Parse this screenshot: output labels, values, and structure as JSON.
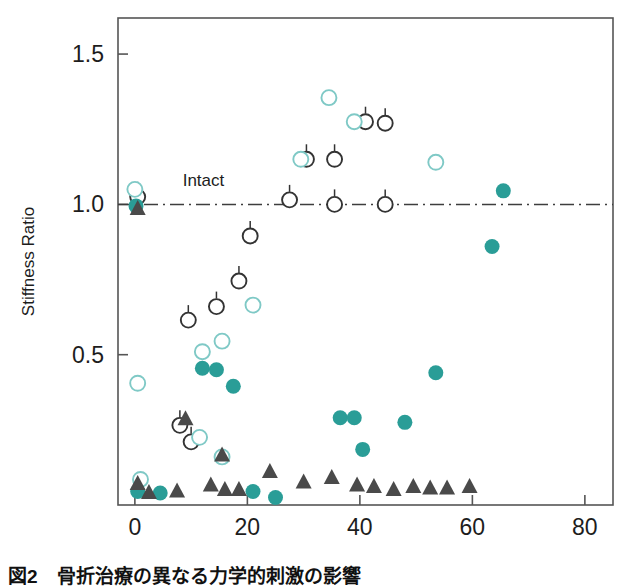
{
  "figure": {
    "caption": "図2　骨折治療の異なる力学的刺激の影響"
  },
  "chart_data": {
    "type": "scatter",
    "title": "",
    "xlabel": "Days, Post-Fracture",
    "ylabel": "Stiffness Ratio",
    "xlim": [
      -3,
      85
    ],
    "ylim": [
      0.0,
      1.62
    ],
    "xticks": [
      0,
      20,
      40,
      60,
      80
    ],
    "xtick_labels": [
      "0",
      "20",
      "40",
      "60",
      "80"
    ],
    "yticks": [
      0.5,
      1.0,
      1.5
    ],
    "ytick_labels": [
      "0.5",
      "1.0",
      "1.5"
    ],
    "grid": false,
    "legend_position": "none",
    "annotations": [
      {
        "text": "Intact",
        "x": 8.5,
        "y": 1.06,
        "line": {
          "type": "dash-dot",
          "y": 1.0,
          "x_start": -3,
          "x_end": 85,
          "color": "#3d3d3d"
        }
      }
    ],
    "colors": {
      "open_dark_circle": "#333333",
      "open_teal_circle": "#7fc9c6",
      "filled_teal_circle": "#2a9d97",
      "filled_dark_triangle": "#4a4a4a",
      "axis": "#555555",
      "background": "#ffffff"
    },
    "series": [
      {
        "name": "Open dark circle (with error bar)",
        "marker": "open-circle-dark",
        "points": [
          {
            "x": 0.5,
            "y": 1.025
          },
          {
            "x": 8.0,
            "y": 0.265
          },
          {
            "x": 9.5,
            "y": 0.615
          },
          {
            "x": 10.0,
            "y": 0.21
          },
          {
            "x": 14.5,
            "y": 0.66
          },
          {
            "x": 18.5,
            "y": 0.745
          },
          {
            "x": 20.5,
            "y": 0.895
          },
          {
            "x": 27.5,
            "y": 1.015
          },
          {
            "x": 30.5,
            "y": 1.15
          },
          {
            "x": 35.5,
            "y": 1.15
          },
          {
            "x": 35.5,
            "y": 1.0
          },
          {
            "x": 41.0,
            "y": 1.275
          },
          {
            "x": 44.5,
            "y": 1.27
          },
          {
            "x": 44.5,
            "y": 1.0
          }
        ]
      },
      {
        "name": "Open teal circle",
        "marker": "open-circle-teal",
        "points": [
          {
            "x": 0.0,
            "y": 1.05
          },
          {
            "x": 0.5,
            "y": 0.405
          },
          {
            "x": 1.0,
            "y": 0.085
          },
          {
            "x": 11.5,
            "y": 0.225
          },
          {
            "x": 12.0,
            "y": 0.51
          },
          {
            "x": 15.5,
            "y": 0.545
          },
          {
            "x": 15.5,
            "y": 0.16
          },
          {
            "x": 21.0,
            "y": 0.665
          },
          {
            "x": 29.5,
            "y": 1.15
          },
          {
            "x": 34.5,
            "y": 1.355
          },
          {
            "x": 39.0,
            "y": 1.275
          },
          {
            "x": 53.5,
            "y": 1.14
          }
        ]
      },
      {
        "name": "Filled teal circle",
        "marker": "filled-circle-teal",
        "points": [
          {
            "x": 0.2,
            "y": 0.995
          },
          {
            "x": 0.5,
            "y": 0.045
          },
          {
            "x": 4.5,
            "y": 0.04
          },
          {
            "x": 12.0,
            "y": 0.455
          },
          {
            "x": 14.5,
            "y": 0.45
          },
          {
            "x": 17.5,
            "y": 0.395
          },
          {
            "x": 21.0,
            "y": 0.045
          },
          {
            "x": 25.0,
            "y": 0.025
          },
          {
            "x": 36.5,
            "y": 0.29
          },
          {
            "x": 39.0,
            "y": 0.29
          },
          {
            "x": 40.5,
            "y": 0.185
          },
          {
            "x": 48.0,
            "y": 0.275
          },
          {
            "x": 53.5,
            "y": 0.44
          },
          {
            "x": 63.5,
            "y": 0.86
          },
          {
            "x": 65.5,
            "y": 1.045
          }
        ]
      },
      {
        "name": "Filled dark triangle",
        "marker": "filled-triangle-dark",
        "points": [
          {
            "x": 0.5,
            "y": 0.99
          },
          {
            "x": 0.5,
            "y": 0.075
          },
          {
            "x": 2.5,
            "y": 0.045
          },
          {
            "x": 7.5,
            "y": 0.05
          },
          {
            "x": 9.0,
            "y": 0.29
          },
          {
            "x": 13.5,
            "y": 0.07
          },
          {
            "x": 16.0,
            "y": 0.055
          },
          {
            "x": 15.5,
            "y": 0.17
          },
          {
            "x": 18.5,
            "y": 0.055
          },
          {
            "x": 24.0,
            "y": 0.115
          },
          {
            "x": 30.0,
            "y": 0.08
          },
          {
            "x": 35.0,
            "y": 0.095
          },
          {
            "x": 39.5,
            "y": 0.07
          },
          {
            "x": 42.5,
            "y": 0.065
          },
          {
            "x": 46.0,
            "y": 0.055
          },
          {
            "x": 49.5,
            "y": 0.065
          },
          {
            "x": 52.5,
            "y": 0.06
          },
          {
            "x": 55.5,
            "y": 0.06
          },
          {
            "x": 59.5,
            "y": 0.065
          }
        ]
      }
    ]
  }
}
